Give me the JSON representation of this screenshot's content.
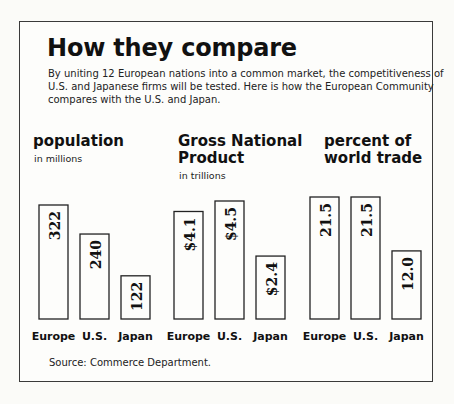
{
  "title": "How they compare",
  "intro_lines": [
    "By uniting 12 European nations into a common market, the competitiveness of",
    "U.S.  and Japanese firms will be tested.  Here is how the European Community",
    "compares with the U.S. and Japan."
  ],
  "source": "Source:   Commerce Department.",
  "chart_data": [
    {
      "type": "bar",
      "title": "population",
      "subtitle": "in millions",
      "categories": [
        "Europe",
        "U.S.",
        "Japan"
      ],
      "values": [
        322,
        240,
        122
      ],
      "data_labels": [
        "322",
        "240",
        "122"
      ],
      "xlabel": "",
      "ylabel": "",
      "grid": false
    },
    {
      "type": "bar",
      "title": "Gross National Product",
      "title_lines": [
        "Gross National",
        "Product"
      ],
      "subtitle": "in trillions",
      "categories": [
        "Europe",
        "U.S.",
        "Japan"
      ],
      "values": [
        4.1,
        4.5,
        2.4
      ],
      "data_labels": [
        "$4.1",
        "$4.5",
        "$2.4"
      ],
      "xlabel": "",
      "ylabel": "",
      "grid": false
    },
    {
      "type": "bar",
      "title": "percent of world trade",
      "title_lines": [
        "percent of",
        "world trade"
      ],
      "subtitle": "",
      "categories": [
        "Europe",
        "U.S.",
        "Japan"
      ],
      "values": [
        21.5,
        21.5,
        12.0
      ],
      "data_labels": [
        "21.5",
        "21.5",
        "12.0"
      ],
      "xlabel": "",
      "ylabel": "",
      "grid": false
    }
  ]
}
